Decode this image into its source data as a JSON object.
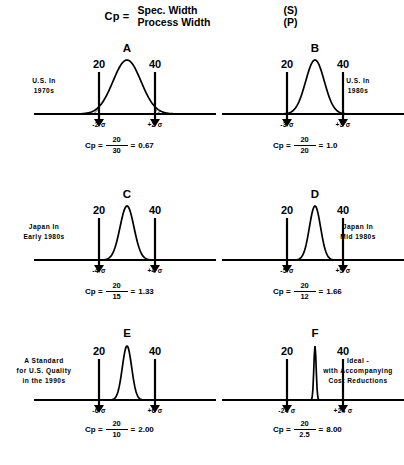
{
  "header": {
    "cp_label": "Cp =",
    "numerator_left": "Spec. Width",
    "numerator_right": "(S)",
    "denominator_left": "Process Width",
    "denominator_right": "(P)"
  },
  "chart_data": {
    "type": "line",
    "xlabel": "",
    "ylabel": "",
    "panels": [
      {
        "letter": "A",
        "caption": "U.S.  In\n1970s",
        "caption_line1": "U.S.  In",
        "caption_line2": "1970s",
        "caption_side": "left",
        "lower_spec": "20",
        "upper_spec": "40",
        "lower_sigma": "-2 σ",
        "upper_sigma": "+2 σ",
        "cp_label": "Cp =",
        "numerator": "20",
        "denominator": "30",
        "equals": "=",
        "cp_value": "0.67",
        "sigma_count": 2,
        "process_width": 30,
        "spec_width": 20,
        "tails_hatched": true
      },
      {
        "letter": "B",
        "caption_line1": "U.S.  In",
        "caption_line2": "1980s",
        "caption_side": "right",
        "lower_spec": "20",
        "upper_spec": "40",
        "lower_sigma": "-3 σ",
        "upper_sigma": "+3 σ",
        "cp_label": "Cp =",
        "numerator": "20",
        "denominator": "20",
        "equals": "=",
        "cp_value": "1.0",
        "sigma_count": 3,
        "process_width": 20,
        "spec_width": 20,
        "tails_hatched": false
      },
      {
        "letter": "C",
        "caption_line1": "Japan  In",
        "caption_line2": "Early  1980s",
        "caption_side": "left",
        "lower_spec": "20",
        "upper_spec": "40",
        "lower_sigma": "-4 σ",
        "upper_sigma": "+4 σ",
        "cp_label": "Cp =",
        "numerator": "20",
        "denominator": "15",
        "equals": "=",
        "cp_value": "1.33",
        "sigma_count": 4,
        "process_width": 15,
        "spec_width": 20,
        "tails_hatched": false
      },
      {
        "letter": "D",
        "caption_line1": "Japan  In",
        "caption_line2": "Mid  1980s",
        "caption_side": "right",
        "lower_spec": "20",
        "upper_spec": "40",
        "lower_sigma": "-5 σ",
        "upper_sigma": "+5 σ",
        "cp_label": "Cp =",
        "numerator": "20",
        "denominator": "12",
        "equals": "=",
        "cp_value": "1.66",
        "sigma_count": 5,
        "process_width": 12,
        "spec_width": 20,
        "tails_hatched": false
      },
      {
        "letter": "E",
        "caption_line1": "A Standard",
        "caption_line2": "for U.S. Quality",
        "caption_line3": "in the 1990s",
        "caption_side": "left",
        "lower_spec": "20",
        "upper_spec": "40",
        "lower_sigma": "-6 σ",
        "upper_sigma": "+6 σ",
        "cp_label": "Cp =",
        "numerator": "20",
        "denominator": "10",
        "equals": "=",
        "cp_value": "2.00",
        "sigma_count": 6,
        "process_width": 10,
        "spec_width": 20,
        "tails_hatched": false
      },
      {
        "letter": "F",
        "caption_line1": "Ideal  -",
        "caption_line2": "with  Accompanying",
        "caption_line3": "Cost  Reductions",
        "caption_side": "right",
        "lower_spec": "20",
        "upper_spec": "40",
        "lower_sigma": "-24 σ",
        "upper_sigma": "+24 σ",
        "cp_label": "Cp =",
        "numerator": "20",
        "denominator": "2.5",
        "equals": "=",
        "cp_value": "8.00",
        "sigma_count": 24,
        "process_width": 2.5,
        "spec_width": 20,
        "tails_hatched": false
      }
    ]
  }
}
